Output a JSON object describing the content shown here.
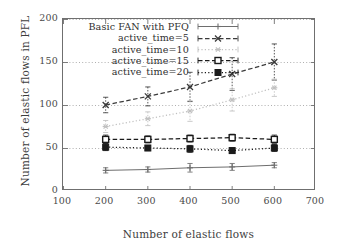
{
  "chart_data": {
    "type": "line",
    "title": "",
    "xlabel": "Number of elastic flows",
    "ylabel": "Number of elastic flows in PFL",
    "x": [
      200,
      300,
      400,
      500,
      600
    ],
    "xlim": [
      100,
      700
    ],
    "ylim": [
      0,
      200
    ],
    "xticks": [
      "100",
      "200",
      "300",
      "400",
      "500",
      "600",
      "700"
    ],
    "yticks": [
      "0",
      "50",
      "100",
      "150",
      "200"
    ],
    "grid": "horizontal-dotted",
    "legend_position": "upper-left-inside",
    "series": [
      {
        "name": "Basic FAN with PFQ",
        "values": [
          24,
          25,
          27,
          28,
          30
        ],
        "errors": [
          3,
          3,
          5,
          4,
          3
        ],
        "color": "#6e6e6e",
        "style": "solid",
        "marker": "plus"
      },
      {
        "name": "active_time=5",
        "values": [
          100,
          110,
          121,
          136,
          150
        ],
        "errors": [
          9,
          11,
          17,
          19,
          21
        ],
        "color": "#3a3a3a",
        "style": "dashed",
        "marker": "cross"
      },
      {
        "name": "active_time=10",
        "values": [
          75,
          84,
          93,
          106,
          120
        ],
        "errors": [
          7,
          8,
          12,
          13,
          10
        ],
        "color": "#c0c0c0",
        "style": "dotted",
        "marker": "star"
      },
      {
        "name": "active_time=15",
        "values": [
          60,
          60,
          61,
          62,
          60
        ],
        "errors": [
          5,
          4,
          4,
          4,
          5
        ],
        "color": "#1a1a1a",
        "style": "dashed",
        "marker": "open-square"
      },
      {
        "name": "active_time=20",
        "values": [
          51,
          50,
          49,
          47,
          50
        ],
        "errors": [
          4,
          3,
          4,
          3,
          4
        ],
        "color": "#1a1a1a",
        "style": "dotted",
        "marker": "filled-square"
      }
    ]
  },
  "axis": {
    "x_title": "Number of elastic flows",
    "y_title": "Number of elastic flows in PFL"
  }
}
